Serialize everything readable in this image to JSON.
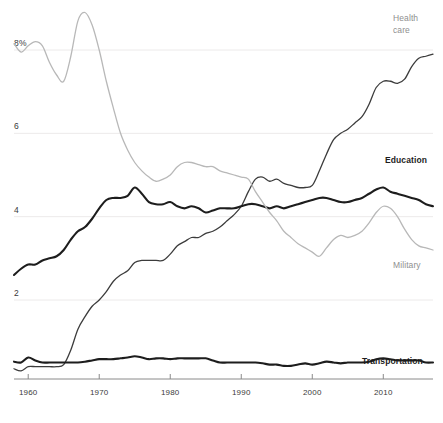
{
  "chart_data": {
    "type": "line",
    "title": "",
    "subtitle": "",
    "xlabel": "",
    "ylabel": "",
    "xlim": [
      1958,
      2017
    ],
    "ylim": [
      0,
      9.1
    ],
    "grid": true,
    "grid_axis": "y",
    "legend_position": "inline-end-of-line",
    "y_ticks": [
      2,
      4,
      6,
      8
    ],
    "y_tick_labels": [
      "2",
      "4",
      "6",
      "8%"
    ],
    "x_ticks": [
      1960,
      1970,
      1980,
      1990,
      2000,
      2010
    ],
    "x_tick_labels": [
      "1960",
      "1970",
      "1980",
      "1990",
      "2000",
      "2010"
    ],
    "series": [
      {
        "name": "Health care",
        "label": "Health care",
        "label_line1": "Health",
        "label_line2": "care",
        "color": "#3c3c3c",
        "style": "dark",
        "stroke_width": 1.3,
        "x": [
          1958,
          1959,
          1960,
          1961,
          1962,
          1963,
          1964,
          1965,
          1966,
          1967,
          1968,
          1969,
          1970,
          1971,
          1972,
          1973,
          1974,
          1975,
          1976,
          1977,
          1978,
          1979,
          1980,
          1981,
          1982,
          1983,
          1984,
          1985,
          1986,
          1987,
          1988,
          1989,
          1990,
          1991,
          1992,
          1993,
          1994,
          1995,
          1996,
          1997,
          1998,
          1999,
          2000,
          2001,
          2002,
          2003,
          2004,
          2005,
          2006,
          2007,
          2008,
          2009,
          2010,
          2011,
          2012,
          2013,
          2014,
          2015,
          2016,
          2017
        ],
        "values": [
          0.35,
          0.3,
          0.4,
          0.4,
          0.4,
          0.4,
          0.4,
          0.45,
          0.8,
          1.3,
          1.6,
          1.85,
          2.0,
          2.2,
          2.45,
          2.6,
          2.7,
          2.9,
          2.95,
          2.95,
          2.95,
          2.95,
          3.1,
          3.3,
          3.4,
          3.5,
          3.5,
          3.6,
          3.65,
          3.75,
          3.9,
          4.05,
          4.25,
          4.6,
          4.9,
          4.95,
          4.85,
          4.9,
          4.8,
          4.75,
          4.7,
          4.7,
          4.75,
          5.1,
          5.5,
          5.85,
          6.0,
          6.1,
          6.25,
          6.4,
          6.7,
          7.1,
          7.25,
          7.25,
          7.2,
          7.3,
          7.6,
          7.8,
          7.85,
          7.9
        ]
      },
      {
        "name": "Education",
        "label": "Education",
        "color": "#1d1d1d",
        "style": "dark-bold",
        "stroke_width": 2.1,
        "x": [
          1958,
          1959,
          1960,
          1961,
          1962,
          1963,
          1964,
          1965,
          1966,
          1967,
          1968,
          1969,
          1970,
          1971,
          1972,
          1973,
          1974,
          1975,
          1976,
          1977,
          1978,
          1979,
          1980,
          1981,
          1982,
          1983,
          1984,
          1985,
          1986,
          1987,
          1988,
          1989,
          1990,
          1991,
          1992,
          1993,
          1994,
          1995,
          1996,
          1997,
          1998,
          1999,
          2000,
          2001,
          2002,
          2003,
          2004,
          2005,
          2006,
          2007,
          2008,
          2009,
          2010,
          2011,
          2012,
          2013,
          2014,
          2015,
          2016,
          2017
        ],
        "values": [
          2.6,
          2.75,
          2.85,
          2.85,
          2.95,
          3.0,
          3.05,
          3.2,
          3.45,
          3.65,
          3.75,
          3.95,
          4.2,
          4.4,
          4.45,
          4.45,
          4.5,
          4.7,
          4.55,
          4.35,
          4.3,
          4.3,
          4.35,
          4.25,
          4.2,
          4.25,
          4.2,
          4.1,
          4.15,
          4.2,
          4.2,
          4.2,
          4.25,
          4.3,
          4.3,
          4.25,
          4.2,
          4.25,
          4.2,
          4.25,
          4.3,
          4.35,
          4.4,
          4.45,
          4.45,
          4.4,
          4.35,
          4.35,
          4.4,
          4.45,
          4.55,
          4.65,
          4.7,
          4.6,
          4.55,
          4.5,
          4.45,
          4.4,
          4.3,
          4.25
        ]
      },
      {
        "name": "Military",
        "label": "Military",
        "color": "#b8b8b8",
        "style": "light",
        "stroke_width": 1.3,
        "x": [
          1958,
          1959,
          1960,
          1961,
          1962,
          1963,
          1964,
          1965,
          1966,
          1967,
          1968,
          1969,
          1970,
          1971,
          1972,
          1973,
          1974,
          1975,
          1976,
          1977,
          1978,
          1979,
          1980,
          1981,
          1982,
          1983,
          1984,
          1985,
          1986,
          1987,
          1988,
          1989,
          1990,
          1991,
          1992,
          1993,
          1994,
          1995,
          1996,
          1997,
          1998,
          1999,
          2000,
          2001,
          2002,
          2003,
          2004,
          2005,
          2006,
          2007,
          2008,
          2009,
          2010,
          2011,
          2012,
          2013,
          2014,
          2015,
          2016,
          2017
        ],
        "values": [
          8.15,
          7.95,
          8.1,
          8.2,
          8.1,
          7.7,
          7.4,
          7.25,
          7.85,
          8.7,
          8.9,
          8.6,
          8.0,
          7.25,
          6.6,
          6.0,
          5.6,
          5.3,
          5.1,
          4.95,
          4.85,
          4.9,
          5.0,
          5.2,
          5.3,
          5.3,
          5.25,
          5.2,
          5.2,
          5.1,
          5.05,
          5.0,
          4.95,
          4.9,
          4.6,
          4.35,
          4.1,
          3.9,
          3.65,
          3.5,
          3.35,
          3.25,
          3.15,
          3.05,
          3.25,
          3.45,
          3.55,
          3.5,
          3.55,
          3.65,
          3.85,
          4.1,
          4.25,
          4.2,
          4.0,
          3.7,
          3.45,
          3.3,
          3.25,
          3.2
        ]
      },
      {
        "name": "Transportation",
        "label": "Transportation",
        "color": "#1d1d1d",
        "style": "dark-bold",
        "stroke_width": 2.1,
        "x": [
          1958,
          1959,
          1960,
          1961,
          1962,
          1963,
          1964,
          1965,
          1966,
          1967,
          1968,
          1969,
          1970,
          1971,
          1972,
          1973,
          1974,
          1975,
          1976,
          1977,
          1978,
          1979,
          1980,
          1981,
          1982,
          1983,
          1984,
          1985,
          1986,
          1987,
          1988,
          1989,
          1990,
          1991,
          1992,
          1993,
          1994,
          1995,
          1996,
          1997,
          1998,
          1999,
          2000,
          2001,
          2002,
          2003,
          2004,
          2005,
          2006,
          2007,
          2008,
          2009,
          2010,
          2011,
          2012,
          2013,
          2014,
          2015,
          2016,
          2017
        ],
        "values": [
          0.52,
          0.5,
          0.62,
          0.55,
          0.5,
          0.5,
          0.5,
          0.5,
          0.5,
          0.5,
          0.52,
          0.55,
          0.58,
          0.58,
          0.58,
          0.6,
          0.62,
          0.65,
          0.62,
          0.58,
          0.6,
          0.6,
          0.58,
          0.6,
          0.6,
          0.6,
          0.6,
          0.6,
          0.55,
          0.5,
          0.5,
          0.5,
          0.5,
          0.5,
          0.5,
          0.48,
          0.45,
          0.45,
          0.42,
          0.42,
          0.45,
          0.48,
          0.45,
          0.48,
          0.52,
          0.5,
          0.48,
          0.5,
          0.5,
          0.5,
          0.52,
          0.58,
          0.6,
          0.58,
          0.55,
          0.55,
          0.55,
          0.55,
          0.5,
          0.5
        ]
      }
    ]
  },
  "labels": {
    "health_care_line1": "Health",
    "health_care_line2": "care",
    "education": "Education",
    "military": "Military",
    "transportation": "Transportation"
  },
  "axis": {
    "y_labels": [
      "8%",
      "6",
      "4",
      "2"
    ],
    "x_labels": [
      "1960",
      "1970",
      "1980",
      "1990",
      "2000",
      "2010"
    ]
  },
  "colors": {
    "dark": "#1d1d1d",
    "mid_dark": "#3c3c3c",
    "light_grey": "#b8b8b8",
    "gridline": "#eceaea",
    "axis": "#8a8a8a",
    "background": "#ffffff"
  }
}
